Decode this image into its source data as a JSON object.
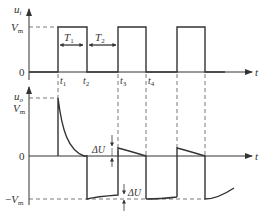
{
  "diagram": {
    "upper_plot": {
      "y_axis_label": "u",
      "y_axis_sub": "i",
      "x_axis_label": "t",
      "ticks_y": {
        "vm": "V",
        "vm_sub": "m",
        "zero": "0"
      },
      "time_marks": [
        {
          "label": "t",
          "sub": "1"
        },
        {
          "label": "t",
          "sub": "2"
        },
        {
          "label": "t",
          "sub": "3"
        },
        {
          "label": "t",
          "sub": "4"
        }
      ],
      "intervals": [
        {
          "label": "T",
          "sub": "1"
        },
        {
          "label": "T",
          "sub": "2"
        }
      ]
    },
    "lower_plot": {
      "y_axis_label": "u",
      "y_axis_sub": "o",
      "x_axis_label": "t",
      "ticks_y": {
        "vm": "V",
        "vm_sub": "m",
        "zero": "0",
        "neg_vm_prefix": "−",
        "neg_vm": "V",
        "neg_vm_sub": "m"
      },
      "annotations": [
        {
          "label": "ΔU"
        },
        {
          "label": "ΔU"
        }
      ]
    },
    "colors": {
      "line": "#333333",
      "dash": "#555555"
    }
  }
}
